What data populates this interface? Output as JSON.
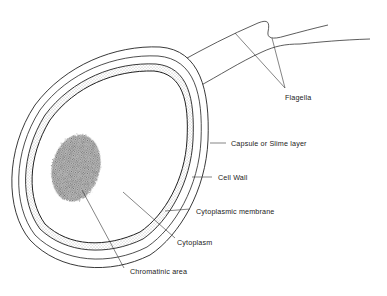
{
  "diagram": {
    "labels": {
      "flagella": "Flagella",
      "capsule": "Capsule or Slime layer",
      "cell_wall": "Cell Wall",
      "cytoplasmic_membrane": "Cytoplasmic membrane",
      "cytoplasm": "Cytoplasm",
      "chromatinic_area": "Chromatinic area"
    }
  }
}
